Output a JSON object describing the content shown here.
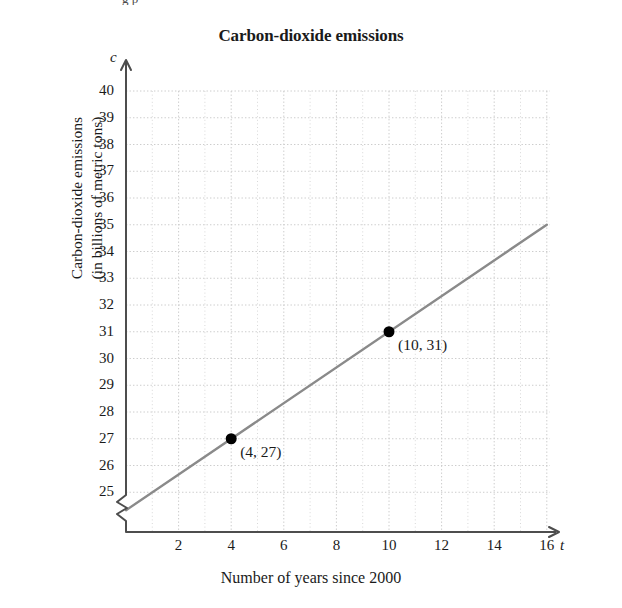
{
  "page": {
    "top_remnant": "g p"
  },
  "chart_data": {
    "type": "line",
    "title": "Carbon-dioxide emissions",
    "xlabel": "Number of years since 2000",
    "ylabel": "Carbon-dioxide emissions (in billions of metric tons)",
    "ylabel_line1": "Carbon-dioxide emissions",
    "ylabel_line2": "(in billions of metric tons)",
    "x_axis_symbol": "t",
    "y_axis_symbol": "c",
    "grid": true,
    "grid_style": "dotted",
    "legend": "none",
    "axis_break_y": true,
    "xlim": [
      0,
      16
    ],
    "ylim": [
      24,
      40
    ],
    "xticks": [
      2,
      4,
      6,
      8,
      10,
      12,
      14,
      16
    ],
    "xtick_labels": [
      "2",
      "4",
      "6",
      "8",
      "10",
      "12",
      "14",
      "16"
    ],
    "yticks": [
      25,
      26,
      27,
      28,
      29,
      30,
      31,
      32,
      33,
      34,
      35,
      36,
      37,
      38,
      39,
      40
    ],
    "ytick_labels": [
      "25",
      "26",
      "27",
      "28",
      "29",
      "30",
      "31",
      "32",
      "33",
      "34",
      "35",
      "36",
      "37",
      "38",
      "39",
      "40"
    ],
    "series": [
      {
        "name": "CO2 emissions trend line",
        "type": "line",
        "color": "#8a8a8a",
        "x": [
          0,
          16
        ],
        "y": [
          24.33,
          35.0
        ],
        "slope": 0.6667,
        "intercept": 24.3333
      }
    ],
    "points": [
      {
        "x": 4,
        "y": 27,
        "label": "(4, 27)",
        "marker": "filled-circle",
        "color": "#000000"
      },
      {
        "x": 10,
        "y": 31,
        "label": "(10, 31)",
        "marker": "filled-circle",
        "color": "#000000"
      }
    ],
    "colors": {
      "line": "#8a8a8a",
      "axis": "#4d4d4d",
      "grid": "#cccccc",
      "marker": "#000000",
      "text": "#1a1a1a",
      "background": "#ffffff"
    }
  }
}
